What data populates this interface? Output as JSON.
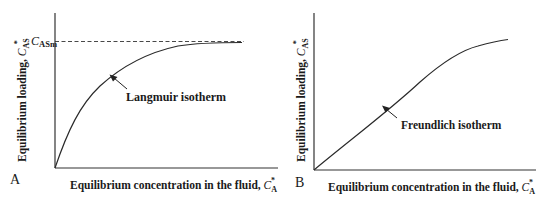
{
  "panels": [
    {
      "letter": "A",
      "y_axis_label": "Equilibrium loading, ",
      "y_symbol": "C",
      "y_sub": "AS",
      "y_sup": "*",
      "x_axis_label": "Equilibrium concentration in the fluid, ",
      "x_symbol": "C",
      "x_sub": "A",
      "x_sup": "*",
      "curve_label": "Langmuir isotherm",
      "asymptote_symbol": "C",
      "asymptote_sub": "ASm"
    },
    {
      "letter": "B",
      "y_axis_label": "Equilibrium loading, ",
      "y_symbol": "C",
      "y_sub": "AS",
      "y_sup": "*",
      "x_axis_label": "Equilibrium concentration in the fluid, ",
      "x_symbol": "C",
      "x_sub": "A",
      "x_sup": "*",
      "curve_label": "Freundlich isotherm"
    }
  ],
  "colors": {
    "line": "#2a2a2a",
    "background": "#ffffff"
  }
}
